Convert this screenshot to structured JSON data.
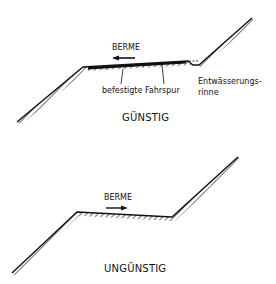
{
  "diagrams": [
    {
      "id": "favorable",
      "title": "GÜNSTIG",
      "berm_label": "BERME",
      "arrow_direction": "left",
      "labels": {
        "paved_lane": "befestigte Fahrspur",
        "drainage_line1": "Entwässerungs-",
        "drainage_line2": "rinne"
      }
    },
    {
      "id": "unfavorable",
      "title": "UNGÜNSTIG",
      "berm_label": "BERME",
      "arrow_direction": "right"
    }
  ],
  "colors": {
    "ink": "#111111",
    "background": "#ffffff"
  }
}
